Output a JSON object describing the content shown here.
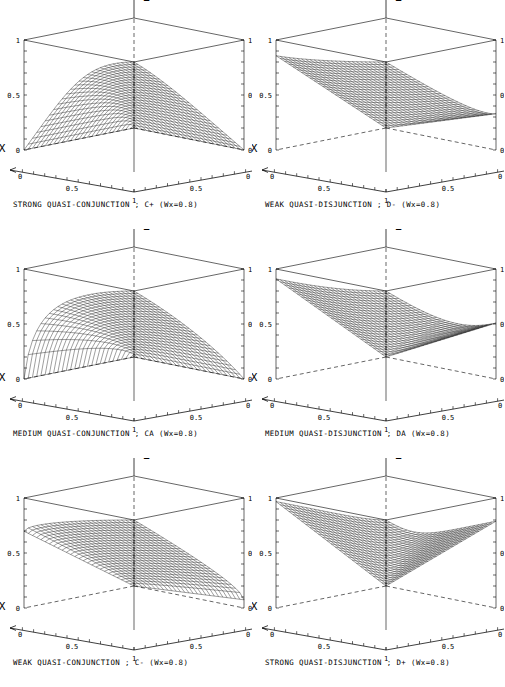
{
  "figure": {
    "type": "multi-panel-3d-surface-grid",
    "rows": 3,
    "cols": 2,
    "width": 505,
    "height": 687,
    "background": "#ffffff",
    "ink_color": "#000000"
  },
  "axes_common": {
    "x_label": "X",
    "y_label": "Y",
    "z_label": "Z",
    "x_ticks": [
      "0",
      "0.5",
      "1"
    ],
    "y_ticks": [
      "1",
      "0.5",
      "0"
    ],
    "z_ticks": [
      "0",
      "0.5",
      "1"
    ],
    "z_left_labels": [
      "0",
      "0.5",
      "1"
    ],
    "z_right_labels": [
      "0",
      "0.5",
      "1"
    ],
    "xlim": [
      0,
      1
    ],
    "ylim": [
      0,
      1
    ],
    "zlim": [
      0,
      1
    ],
    "grid": false,
    "box": true,
    "minor_ticks_per_axis": 10
  },
  "chart_data": [
    {
      "id": "panel-strong-quasi-conjunction",
      "type": "surface",
      "title": "STRONG QUASI-CONJUNCTION ; C+ (Wx=0.8)",
      "operator_symbol": "C+",
      "operator_name": "STRONG QUASI-CONJUNCTION",
      "weight_label": "Wx=0.8",
      "wx": 0.8,
      "wy": 0.2,
      "r": -3.51,
      "xlabel": "X",
      "ylabel": "Y",
      "zlabel": "Z",
      "xlim": [
        0,
        1
      ],
      "ylim": [
        0,
        1
      ],
      "zlim": [
        0,
        1
      ],
      "n": 26,
      "corner_values": {
        "x0y0": 0,
        "x1y0": 0,
        "x0y1": 0,
        "x1y1": 1
      },
      "peak_value": 1.0
    },
    {
      "id": "panel-weak-quasi-disjunction",
      "type": "surface",
      "title": "WEAK QUASI-DISJUNCTION ; D- (Wx=0.8)",
      "operator_symbol": "D-",
      "operator_name": "WEAK QUASI-DISJUNCTION",
      "weight_label": "Wx=0.8",
      "wx": 0.8,
      "wy": 0.2,
      "r": 1.45,
      "xlabel": "X",
      "ylabel": "Y",
      "zlabel": "Z",
      "xlim": [
        0,
        1
      ],
      "ylim": [
        0,
        1
      ],
      "zlim": [
        0,
        1
      ],
      "n": 26,
      "corner_values": {
        "x0y0": 0,
        "x1y0": 0.84,
        "x0y1": 0.34,
        "x1y1": 1
      },
      "peak_value": 1.0
    },
    {
      "id": "panel-medium-quasi-conjunction",
      "type": "surface",
      "title": "MEDIUM QUASI-CONJUNCTION ; CA (Wx=0.8)",
      "operator_symbol": "CA",
      "operator_name": "MEDIUM QUASI-CONJUNCTION",
      "weight_label": "Wx=0.8",
      "wx": 0.8,
      "wy": 0.2,
      "r": -0.72,
      "xlabel": "X",
      "ylabel": "Y",
      "zlabel": "Z",
      "xlim": [
        0,
        1
      ],
      "ylim": [
        0,
        1
      ],
      "zlim": [
        0,
        1
      ],
      "n": 26,
      "corner_values": {
        "x0y0": 0,
        "x1y0": 0,
        "x0y1": 0,
        "x1y1": 1
      },
      "peak_value": 1.0
    },
    {
      "id": "panel-medium-quasi-disjunction",
      "type": "surface",
      "title": "MEDIUM QUASI-DISJUNCTION ; DA (Wx=0.8)",
      "operator_symbol": "DA",
      "operator_name": "MEDIUM QUASI-DISJUNCTION",
      "weight_label": "Wx=0.8",
      "wx": 0.8,
      "wy": 0.2,
      "r": 2.38,
      "xlabel": "X",
      "ylabel": "Y",
      "zlabel": "Z",
      "xlim": [
        0,
        1
      ],
      "ylim": [
        0,
        1
      ],
      "zlim": [
        0,
        1
      ],
      "n": 26,
      "corner_values": {
        "x0y0": 0,
        "x1y0": 0.91,
        "x0y1": 0.53,
        "x1y1": 1
      },
      "peak_value": 1.0
    },
    {
      "id": "panel-weak-quasi-conjunction",
      "type": "surface",
      "title": "WEAK QUASI-CONJUNCTION ; C- (Wx=0.8)",
      "operator_symbol": "C-",
      "operator_name": "WEAK QUASI-CONJUNCTION",
      "weight_label": "Wx=0.8",
      "wx": 0.8,
      "wy": 0.2,
      "r": 0.62,
      "xlabel": "X",
      "ylabel": "Y",
      "zlabel": "Z",
      "xlim": [
        0,
        1
      ],
      "ylim": [
        0,
        1
      ],
      "zlim": [
        0,
        1
      ],
      "n": 26,
      "corner_values": {
        "x0y0": 0,
        "x1y0": 0.33,
        "x0y1": 0.02,
        "x1y1": 1
      },
      "peak_value": 1.0
    },
    {
      "id": "panel-strong-quasi-disjunction",
      "type": "surface",
      "title": "STRONG QUASI-DISJUNCTION ; D+ (Wx=0.8)",
      "operator_symbol": "D+",
      "operator_name": "STRONG QUASI-DISJUNCTION",
      "weight_label": "Wx=0.8",
      "wx": 0.8,
      "wy": 0.2,
      "r": 6.8,
      "xlabel": "X",
      "ylabel": "Y",
      "zlabel": "Z",
      "xlim": [
        0,
        1
      ],
      "ylim": [
        0,
        1
      ],
      "zlim": [
        0,
        1
      ],
      "n": 26,
      "corner_values": {
        "x0y0": 0,
        "x1y0": 0.97,
        "x0y1": 0.77,
        "x1y1": 1
      },
      "peak_value": 1.0
    }
  ]
}
